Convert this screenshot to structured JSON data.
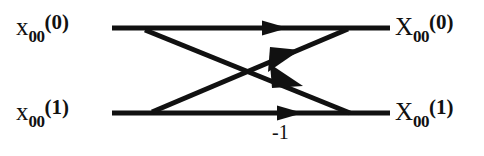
{
  "diagram": {
    "stroke_color": "#111111",
    "background_color": "#ffffff",
    "inputs": [
      {
        "id": "in-0",
        "base": "x",
        "sub": "00",
        "sup": "(0)"
      },
      {
        "id": "in-1",
        "base": "x",
        "sub": "00",
        "sup": "(1)"
      }
    ],
    "outputs": [
      {
        "id": "out-0",
        "base": "X",
        "sub": "00",
        "sup": "(0)"
      },
      {
        "id": "out-1",
        "base": "X",
        "sub": "00",
        "sup": "(1)"
      }
    ],
    "edges": [
      {
        "id": "top-straight",
        "from": "in-0",
        "to": "out-0",
        "weight": ""
      },
      {
        "id": "bottom-straight",
        "from": "in-1",
        "to": "out-1",
        "weight": "-1"
      },
      {
        "id": "cross-down",
        "from": "in-0",
        "to": "out-1",
        "weight": ""
      },
      {
        "id": "cross-up",
        "from": "in-1",
        "to": "out-0",
        "weight": ""
      }
    ],
    "annotations": {
      "twiddle": "-1"
    }
  }
}
